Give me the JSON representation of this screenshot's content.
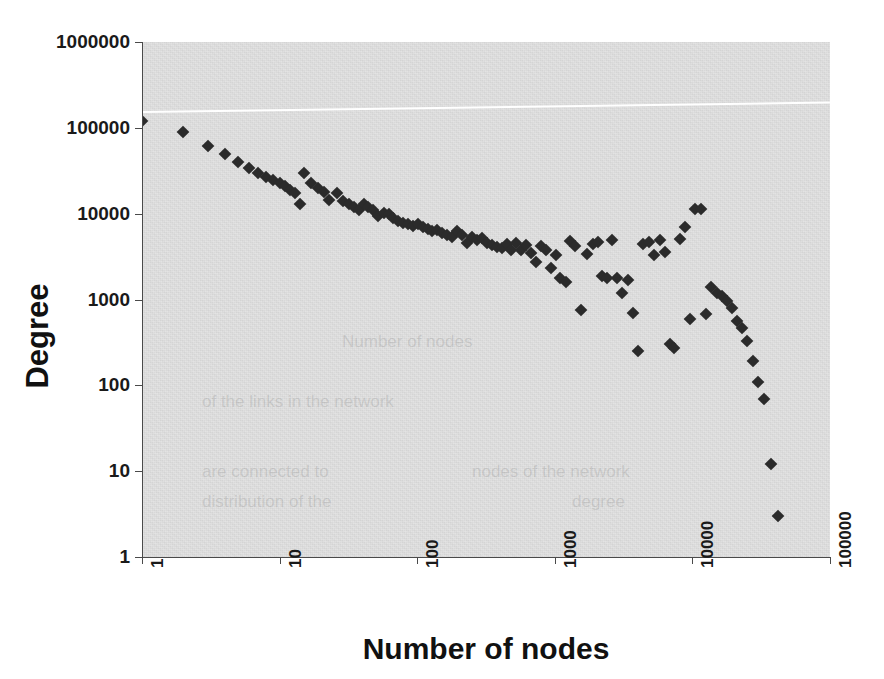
{
  "chart_data": {
    "type": "scatter",
    "title": "",
    "xlabel": "Number of nodes",
    "ylabel": "Degree",
    "xscale": "log",
    "yscale": "log",
    "xlim": [
      1,
      100000
    ],
    "ylim": [
      1,
      1000000
    ],
    "grid": false,
    "legend": null,
    "x_tick_labels": [
      "1",
      "10",
      "100",
      "1000",
      "10000",
      "100000"
    ],
    "y_tick_labels": [
      "1",
      "10",
      "100",
      "1000",
      "10000",
      "100000",
      "1000000"
    ],
    "marker": "diamond",
    "marker_color": "#2b2b2b",
    "plot_background": "#e2e2e2",
    "figure_background": "#ffffff",
    "axis_color": "#4a4a4a",
    "series": [
      {
        "name": "degree",
        "marker": "diamond",
        "color": "#2b2b2b",
        "points": [
          [
            1,
            120000
          ],
          [
            2,
            90000
          ],
          [
            3,
            62000
          ],
          [
            4,
            50000
          ],
          [
            5,
            40000
          ],
          [
            6,
            34000
          ],
          [
            7,
            30000
          ],
          [
            8,
            27000
          ],
          [
            9,
            25000
          ],
          [
            10,
            23000
          ],
          [
            11,
            21000
          ],
          [
            12,
            19000
          ],
          [
            13,
            17500
          ],
          [
            14,
            13000
          ],
          [
            15,
            30000
          ],
          [
            17,
            23000
          ],
          [
            19,
            20000
          ],
          [
            21,
            18000
          ],
          [
            23,
            14500
          ],
          [
            26,
            17500
          ],
          [
            29,
            14000
          ],
          [
            32,
            13000
          ],
          [
            35,
            12000
          ],
          [
            38,
            11000
          ],
          [
            41,
            13000
          ],
          [
            44,
            12000
          ],
          [
            48,
            11000
          ],
          [
            52,
            9500
          ],
          [
            57,
            10200
          ],
          [
            62,
            9800
          ],
          [
            67,
            8800
          ],
          [
            73,
            8200
          ],
          [
            79,
            7800
          ],
          [
            86,
            7600
          ],
          [
            93,
            7200
          ],
          [
            101,
            7600
          ],
          [
            110,
            7000
          ],
          [
            119,
            6600
          ],
          [
            129,
            6200
          ],
          [
            140,
            6400
          ],
          [
            152,
            6000
          ],
          [
            165,
            5600
          ],
          [
            180,
            5400
          ],
          [
            195,
            6200
          ],
          [
            212,
            5600
          ],
          [
            230,
            4600
          ],
          [
            250,
            5400
          ],
          [
            272,
            5000
          ],
          [
            295,
            5200
          ],
          [
            320,
            4600
          ],
          [
            348,
            4300
          ],
          [
            378,
            4100
          ],
          [
            410,
            4000
          ],
          [
            446,
            4400
          ],
          [
            484,
            3800
          ],
          [
            526,
            4600
          ],
          [
            571,
            3800
          ],
          [
            620,
            4300
          ],
          [
            674,
            3500
          ],
          [
            732,
            2700
          ],
          [
            795,
            4200
          ],
          [
            863,
            3800
          ],
          [
            938,
            2300
          ],
          [
            1020,
            3300
          ],
          [
            1100,
            1800
          ],
          [
            1200,
            1600
          ],
          [
            1300,
            4800
          ],
          [
            1400,
            4200
          ],
          [
            1550,
            750
          ],
          [
            1700,
            3400
          ],
          [
            1900,
            4400
          ],
          [
            2050,
            4700
          ],
          [
            2200,
            1900
          ],
          [
            2400,
            1800
          ],
          [
            2600,
            4900
          ],
          [
            2850,
            1800
          ],
          [
            3100,
            1200
          ],
          [
            3400,
            1700
          ],
          [
            3700,
            700
          ],
          [
            4000,
            250
          ],
          [
            4400,
            4400
          ],
          [
            4800,
            4700
          ],
          [
            5300,
            3300
          ],
          [
            5800,
            4900
          ],
          [
            6300,
            3600
          ],
          [
            6900,
            300
          ],
          [
            7400,
            270
          ],
          [
            8100,
            5100
          ],
          [
            8800,
            6900
          ],
          [
            9600,
            600
          ],
          [
            10500,
            11200
          ],
          [
            11500,
            11300
          ],
          [
            12500,
            680
          ],
          [
            13700,
            1400
          ],
          [
            15000,
            1200
          ],
          [
            16300,
            1100
          ],
          [
            17800,
            950
          ],
          [
            19400,
            800
          ],
          [
            21000,
            560
          ],
          [
            23000,
            460
          ],
          [
            25000,
            330
          ],
          [
            27500,
            190
          ],
          [
            30000,
            110
          ],
          [
            33000,
            70
          ],
          [
            37000,
            12
          ],
          [
            42000,
            3
          ]
        ]
      }
    ],
    "trend_line": {
      "color": "#ffffff",
      "description": "white reference line sloping slightly upward across the top of the plot",
      "from": [
        1,
        155000
      ],
      "to": [
        100000,
        200000
      ]
    }
  },
  "ghost_text": [
    {
      "text": "Number of nodes",
      "x": 200,
      "y": 290
    },
    {
      "text": "of the links in the network",
      "x": 60,
      "y": 350
    },
    {
      "text": "are connected to",
      "x": 60,
      "y": 420
    },
    {
      "text": "nodes of the network",
      "x": 330,
      "y": 420
    },
    {
      "text": "distribution of the",
      "x": 60,
      "y": 450
    },
    {
      "text": "degree",
      "x": 430,
      "y": 450
    }
  ]
}
